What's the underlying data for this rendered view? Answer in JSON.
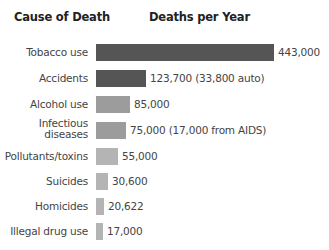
{
  "headers": {
    "cause": "Cause of Death",
    "deaths": "Deaths per Year"
  },
  "colors": {
    "dark": "#555555",
    "mid": "#9c9c9c",
    "light": "#b4b4b4"
  },
  "rows": [
    {
      "label": "Tobacco use",
      "value": 443000,
      "text": "443,000",
      "color": "#555555",
      "top": 44,
      "twoLine": false
    },
    {
      "label": "Accidents",
      "value": 123700,
      "text": "123,700 (33,800 auto)",
      "color": "#555555",
      "top": 70,
      "twoLine": false
    },
    {
      "label": "Alcohol use",
      "value": 85000,
      "text": "85,000",
      "color": "#9c9c9c",
      "top": 96,
      "twoLine": false
    },
    {
      "label": "Infectious diseases",
      "value": 75000,
      "text": "75,000 (17,000 from AIDS)",
      "color": "#9c9c9c",
      "top": 122,
      "twoLine": true
    },
    {
      "label": "Pollutants/toxins",
      "value": 55000,
      "text": "55,000",
      "color": "#b4b4b4",
      "top": 148,
      "twoLine": false
    },
    {
      "label": "Suicides",
      "value": 30600,
      "text": "30,600",
      "color": "#b4b4b4",
      "top": 173,
      "twoLine": false
    },
    {
      "label": "Homicides",
      "value": 20622,
      "text": "20,622",
      "color": "#b4b4b4",
      "top": 198,
      "twoLine": false
    },
    {
      "label": "Illegal drug use",
      "value": 17000,
      "text": "17,000",
      "color": "#b4b4b4",
      "top": 223,
      "twoLine": false
    }
  ],
  "chart_data": {
    "type": "bar",
    "orientation": "horizontal",
    "title": "",
    "xlabel": "Deaths per Year",
    "ylabel": "Cause of Death",
    "categories": [
      "Tobacco use",
      "Accidents",
      "Alcohol use",
      "Infectious diseases",
      "Pollutants/toxins",
      "Suicides",
      "Homicides",
      "Illegal drug use"
    ],
    "values": [
      443000,
      123700,
      85000,
      75000,
      55000,
      30600,
      20622,
      17000
    ],
    "annotations": [
      "443,000",
      "123,700 (33,800 auto)",
      "85,000",
      "75,000 (17,000 from AIDS)",
      "55,000",
      "30,600",
      "20,622",
      "17,000"
    ],
    "grid": false,
    "legend": null,
    "xlim": [
      0,
      443000
    ]
  }
}
